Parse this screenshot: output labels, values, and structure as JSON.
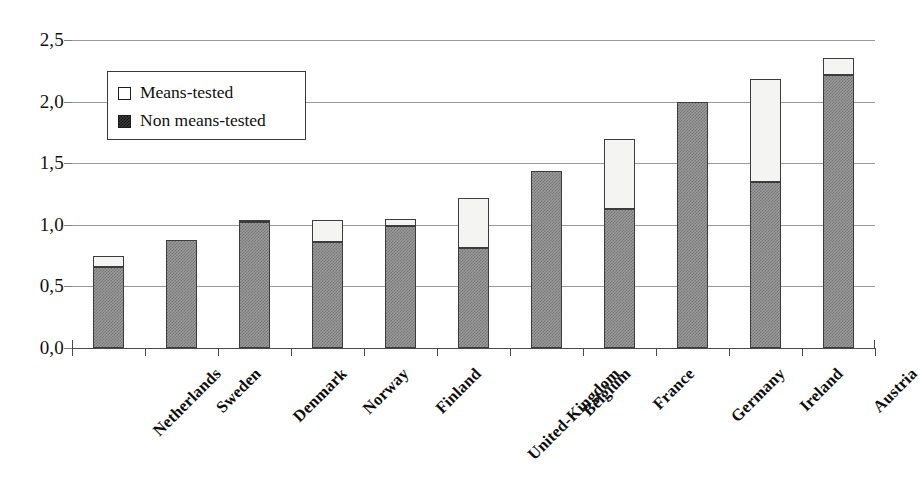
{
  "chart_data": {
    "type": "bar",
    "subtype": "stacked-vertical",
    "title": "",
    "subtitle": "",
    "xlabel": "",
    "ylabel": "",
    "categories": [
      "Netherlands",
      "Sweden",
      "Denmark",
      "Norway",
      "Finland",
      "United-Kingdom",
      "Belgium",
      "France",
      "Germany",
      "Ireland",
      "Austria"
    ],
    "series": [
      {
        "name": "Non means-tested",
        "color": "#8f8f8f",
        "values": [
          0.66,
          0.88,
          1.02,
          0.86,
          0.99,
          0.81,
          1.44,
          1.13,
          2.0,
          1.35,
          2.22
        ]
      },
      {
        "name": "Means-tested",
        "color": "#f4f4f2",
        "values": [
          0.09,
          0.0,
          0.01,
          0.18,
          0.06,
          0.41,
          0.0,
          0.57,
          0.0,
          0.83,
          0.13
        ]
      }
    ],
    "totals": [
      0.75,
      0.88,
      1.03,
      1.04,
      1.05,
      1.22,
      1.44,
      1.7,
      2.0,
      2.18,
      2.35
    ],
    "ylim": [
      0.0,
      2.5
    ],
    "ytick_values": [
      0.0,
      0.5,
      1.0,
      1.5,
      2.0,
      2.5
    ],
    "ytick_labels": [
      "0,0",
      "0,5",
      "1,0",
      "1,5",
      "2,0",
      "2,5"
    ],
    "grid": true,
    "grid_axis": "y",
    "legend_position": "upper-left-inside",
    "legend_entries": [
      "Means-tested",
      "Non means-tested"
    ]
  },
  "legend": {
    "means_tested_label": "Means-tested",
    "non_means_tested_label": "Non means-tested"
  }
}
